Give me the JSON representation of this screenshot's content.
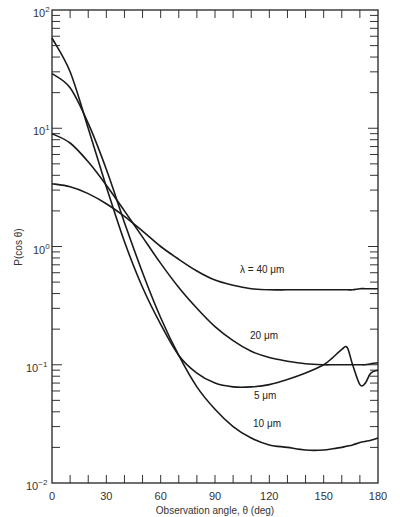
{
  "chart_data": {
    "type": "line",
    "title": "",
    "xlabel": "Observation angle, θ (deg)",
    "ylabel": "P(cos θ)",
    "xlim": [
      0,
      180
    ],
    "ylim": [
      0.01,
      100
    ],
    "yscale": "log",
    "grid": false,
    "legend": "inline curve labels",
    "x_ticks": [
      0,
      30,
      60,
      90,
      120,
      150,
      180
    ],
    "y_ticks": [
      "10^-2",
      "10^-1",
      "10^0",
      "10^1",
      "10^2"
    ],
    "x": [
      0,
      10,
      20,
      30,
      40,
      50,
      60,
      70,
      80,
      90,
      100,
      110,
      120,
      130,
      140,
      150,
      155,
      160,
      163,
      166,
      170,
      173,
      176,
      180
    ],
    "series": [
      {
        "name": "λ = 40 μm",
        "values": [
          3.4,
          3.2,
          2.8,
          2.3,
          1.8,
          1.35,
          1.0,
          0.78,
          0.62,
          0.52,
          0.47,
          0.44,
          0.43,
          0.43,
          0.43,
          0.43,
          0.43,
          0.43,
          0.43,
          0.43,
          0.44,
          0.44,
          0.44,
          0.44
        ]
      },
      {
        "name": "20 μm",
        "values": [
          9.0,
          7.5,
          5.2,
          3.3,
          2.0,
          1.2,
          0.72,
          0.45,
          0.3,
          0.21,
          0.16,
          0.13,
          0.115,
          0.107,
          0.102,
          0.1,
          0.1,
          0.1,
          0.1,
          0.1,
          0.1,
          0.1,
          0.102,
          0.104
        ]
      },
      {
        "name": "5 μm",
        "values": [
          58,
          30,
          10,
          3.2,
          1.1,
          0.45,
          0.22,
          0.12,
          0.085,
          0.07,
          0.065,
          0.065,
          0.068,
          0.075,
          0.085,
          0.1,
          0.115,
          0.135,
          0.14,
          0.1,
          0.068,
          0.07,
          0.085,
          0.09
        ]
      },
      {
        "name": "10 μm",
        "values": [
          29,
          22,
          11,
          4.5,
          1.6,
          0.6,
          0.25,
          0.12,
          0.065,
          0.042,
          0.03,
          0.024,
          0.021,
          0.02,
          0.019,
          0.019,
          0.0195,
          0.02,
          0.0205,
          0.021,
          0.022,
          0.0225,
          0.023,
          0.024
        ]
      }
    ],
    "annotations": [
      {
        "text": "λ = 40 μm",
        "x": 115,
        "y": 0.62
      },
      {
        "text": "20 μm",
        "x": 120,
        "y": 0.14
      },
      {
        "text": "5 μm",
        "x": 118,
        "y": 0.046
      },
      {
        "text": "10 μm",
        "x": 120,
        "y": 0.029
      }
    ]
  },
  "labels": {
    "xlabel": "Observation angle, θ (deg)",
    "ylabel": "P(cos θ)",
    "x_ticks": [
      "0",
      "30",
      "60",
      "90",
      "120",
      "150",
      "180"
    ],
    "y_ticks": [
      {
        "base": "10",
        "exp": "2"
      },
      {
        "base": "10",
        "exp": "1"
      },
      {
        "base": "10",
        "exp": "0"
      },
      {
        "base": "10",
        "exp": "−1"
      },
      {
        "base": "10",
        "exp": "−2"
      }
    ],
    "curve_labels": [
      "λ = 40 μm",
      "20 μm",
      "5 μm",
      "10 μm"
    ]
  }
}
